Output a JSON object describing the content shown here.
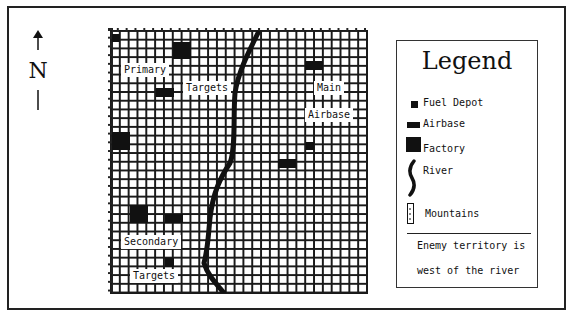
{
  "north_indicator": {
    "letter": "N",
    "arrow": "up-arrow"
  },
  "map": {
    "grid": {
      "columns": 29,
      "rows": 30
    },
    "labels": {
      "primary": "Primary",
      "primary_targets": "Targets",
      "main": "Main",
      "airbase": "Airbase",
      "secondary": "Secondary",
      "secondary_targets": "Targets"
    },
    "symbols": [
      {
        "type": "fuel-depot",
        "x": 1,
        "y": 1
      },
      {
        "type": "factory",
        "x": 8,
        "y": 2
      },
      {
        "type": "airbase",
        "x": 6,
        "y": 7
      },
      {
        "type": "airbase",
        "x": 23,
        "y": 4
      },
      {
        "type": "factory",
        "x": 0,
        "y": 12
      },
      {
        "type": "fuel-depot",
        "x": 23,
        "y": 14
      },
      {
        "type": "airbase",
        "x": 20,
        "y": 15
      },
      {
        "type": "factory",
        "x": 2,
        "y": 21
      },
      {
        "type": "airbase",
        "x": 6,
        "y": 22
      },
      {
        "type": "fuel-depot",
        "x": 6,
        "y": 27
      }
    ]
  },
  "legend": {
    "title": "Legend",
    "items": [
      {
        "icon": "fuel-depot-icon",
        "label": "Fuel Depot"
      },
      {
        "icon": "airbase-icon",
        "label": "Airbase"
      },
      {
        "icon": "factory-icon",
        "label": "Factory"
      },
      {
        "icon": "river-icon",
        "label": "River"
      },
      {
        "icon": "mountains-icon",
        "label": "Mountains"
      }
    ],
    "note_line1": "Enemy territory is",
    "note_line2": "west of the river"
  }
}
